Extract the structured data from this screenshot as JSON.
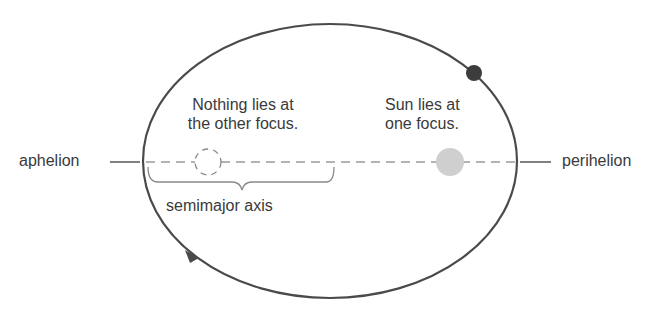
{
  "diagram": {
    "labels": {
      "aphelion": "aphelion",
      "perihelion": "perihelion",
      "empty_focus_line1": "Nothing lies at",
      "empty_focus_line2": "the other focus.",
      "sun_focus_line1": "Sun lies at",
      "sun_focus_line2": "one focus.",
      "semimajor_axis": "semimajor axis"
    },
    "colors": {
      "orbit": "#4a4a4a",
      "planet": "#3c3c3c",
      "sun": "#cfcfcf",
      "dashed_axis": "#9a9a9a",
      "brace": "#8a8a8a",
      "text": "#3a3a3a"
    },
    "elements": {
      "orbit": "ellipse",
      "planet": "filled-dark-circle",
      "sun": "filled-gray-circle",
      "empty_focus": "dashed-circle",
      "direction_arrow": "arrowhead-on-orbit"
    }
  }
}
